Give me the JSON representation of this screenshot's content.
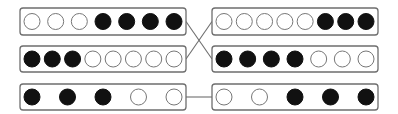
{
  "diagram": {
    "title": "",
    "colors": {
      "box_stroke": "#6e6e6e",
      "filled": "#111111",
      "empty": "#ffffff"
    },
    "left_boxes": [
      {
        "id": "L1",
        "x": 20,
        "y": 8,
        "w": 166,
        "h": 27,
        "dots": [
          0,
          0,
          0,
          1,
          1,
          1,
          1
        ]
      },
      {
        "id": "L2",
        "x": 20,
        "y": 46,
        "w": 166,
        "h": 26,
        "dots": [
          1,
          1,
          1,
          0,
          0,
          0,
          0,
          0
        ]
      },
      {
        "id": "L3",
        "x": 20,
        "y": 84,
        "w": 166,
        "h": 26,
        "dots": [
          1,
          1,
          1,
          0,
          0
        ]
      }
    ],
    "right_boxes": [
      {
        "id": "R1",
        "x": 212,
        "y": 8,
        "w": 166,
        "h": 27,
        "dots": [
          0,
          0,
          0,
          0,
          0,
          1,
          1,
          1
        ]
      },
      {
        "id": "R2",
        "x": 212,
        "y": 46,
        "w": 166,
        "h": 26,
        "dots": [
          1,
          1,
          1,
          1,
          0,
          0,
          0
        ]
      },
      {
        "id": "R3",
        "x": 212,
        "y": 84,
        "w": 166,
        "h": 26,
        "dots": [
          0,
          0,
          1,
          1,
          1
        ]
      }
    ],
    "connections": [
      {
        "from": "L1",
        "to": "R2",
        "type": "cross"
      },
      {
        "from": "L2",
        "to": "R1",
        "type": "cross"
      },
      {
        "from": "L3",
        "to": "R3",
        "type": "straight"
      }
    ],
    "legend": {
      "filled": "black dot",
      "empty": "white dot"
    }
  }
}
